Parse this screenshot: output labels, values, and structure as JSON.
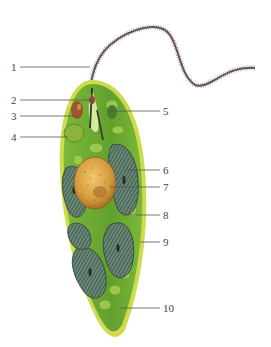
{
  "diagram": {
    "labels_left": [
      {
        "number": "1",
        "y": 67
      },
      {
        "number": "2",
        "y": 100
      },
      {
        "number": "3",
        "y": 116
      },
      {
        "number": "4",
        "y": 137
      }
    ],
    "labels_right": [
      {
        "number": "5",
        "y": 111
      },
      {
        "number": "6",
        "y": 170
      },
      {
        "number": "7",
        "y": 187
      },
      {
        "number": "8",
        "y": 215
      },
      {
        "number": "9",
        "y": 242
      },
      {
        "number": "10",
        "y": 308
      }
    ],
    "colors": {
      "cytoplasm": "#6aa832",
      "pellicle": "#c9d84a",
      "chloroplast": "#4f6e5e",
      "nucleus": "#d9a040",
      "eyespot": "#a0522d",
      "flagellum": "#5a4a4a",
      "line": "#555555"
    }
  }
}
